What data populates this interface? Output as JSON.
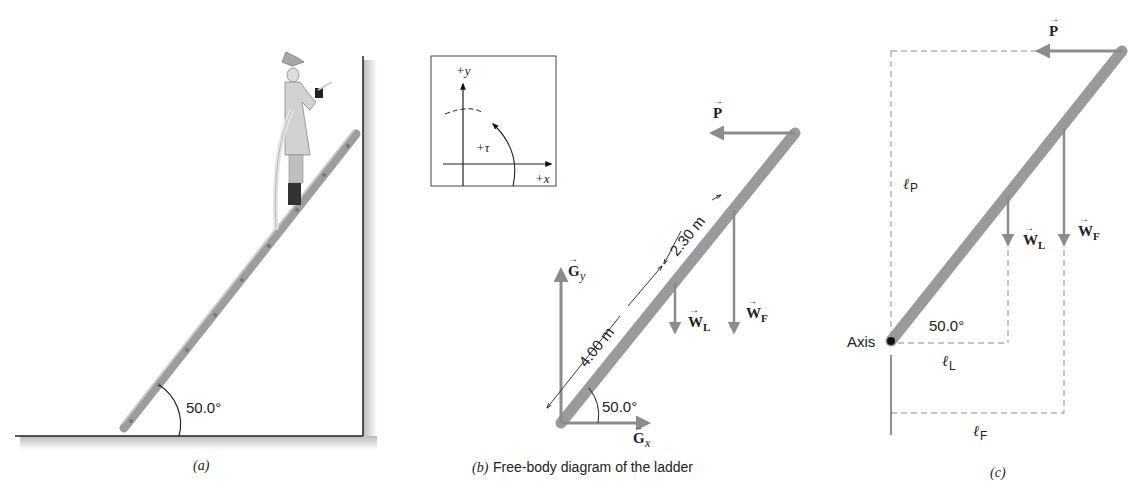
{
  "panel_a": {
    "caption": "(a)",
    "angle_label": "50.0°",
    "subject": "firefighter on ladder against wall"
  },
  "panel_b": {
    "caption_prefix": "(b)",
    "caption_text": "Free-body diagram of the ladder",
    "axes_box": {
      "y_label": "+y",
      "x_label": "+x",
      "torque_label": "+τ"
    },
    "forces": {
      "P": "P",
      "Gy": "G",
      "Gy_sub": "y",
      "Gx": "G",
      "Gx_sub": "x",
      "WL": "W",
      "WL_sub": "L",
      "WF": "W",
      "WF_sub": "F"
    },
    "dim_lower": "4.00 m",
    "dim_upper": "2.30 m",
    "angle_label": "50.0°"
  },
  "panel_c": {
    "caption": "(c)",
    "axis_label": "Axis",
    "angle_label": "50.0°",
    "lever_arms": {
      "lP": "ℓ",
      "lP_sub": "P",
      "lL": "ℓ",
      "lL_sub": "L",
      "lF": "ℓ",
      "lF_sub": "F"
    },
    "forces": {
      "P": "P",
      "WL": "W",
      "WL_sub": "L",
      "WF": "W",
      "WF_sub": "F"
    }
  },
  "colors": {
    "ladder": "#9a9a9a",
    "force_arrow": "#8c8c8c",
    "line": "#222222",
    "dashed": "#8a8a8a"
  }
}
